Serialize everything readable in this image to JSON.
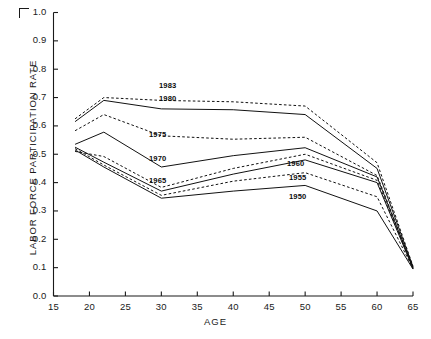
{
  "chart_data": {
    "type": "line",
    "title": "",
    "xlabel": "AGE",
    "ylabel": "LABOR FORCE PARTICIPATION RATE",
    "xlim": [
      15,
      65
    ],
    "ylim": [
      0.0,
      1.0
    ],
    "xticks": [
      "15",
      "20",
      "25",
      "30",
      "35",
      "40",
      "45",
      "50",
      "55",
      "60",
      "65"
    ],
    "yticks": [
      "0.0",
      "0.1",
      "0.2",
      "0.3",
      "0.4",
      "0.5",
      "0.6",
      "0.7",
      "0.8",
      "0.9",
      "1.0"
    ],
    "grid": false,
    "legend_position": "inline-annotations",
    "x": [
      18,
      22,
      30,
      40,
      50,
      60,
      65
    ],
    "series": [
      {
        "name": "1983",
        "style": "dashed",
        "label_x": 159,
        "label_y": 81,
        "values": [
          0.625,
          0.7,
          0.69,
          0.685,
          0.67,
          0.47,
          0.105
        ]
      },
      {
        "name": "1980",
        "style": "solid",
        "label_x": 159,
        "label_y": 94,
        "values": [
          0.615,
          0.69,
          0.66,
          0.657,
          0.64,
          0.45,
          0.103
        ]
      },
      {
        "name": "1975",
        "style": "dashed",
        "label_x": 149,
        "label_y": 130,
        "values": [
          0.583,
          0.64,
          0.565,
          0.553,
          0.56,
          0.425,
          0.101
        ]
      },
      {
        "name": "1970",
        "style": "solid",
        "label_x": 149,
        "label_y": 154,
        "values": [
          0.535,
          0.578,
          0.455,
          0.495,
          0.523,
          0.42,
          0.1
        ]
      },
      {
        "name": "1965",
        "style": "dashed",
        "label_x": 149,
        "label_y": 176,
        "values": [
          0.51,
          0.492,
          0.383,
          0.45,
          0.5,
          0.408,
          0.098
        ]
      },
      {
        "name": "1960",
        "style": "solid",
        "label_x": 287,
        "label_y": 159,
        "values": [
          0.525,
          0.472,
          0.37,
          0.43,
          0.48,
          0.4,
          0.097
        ]
      },
      {
        "name": "1955",
        "style": "dashed",
        "label_x": 289,
        "label_y": 173,
        "values": [
          0.52,
          0.462,
          0.355,
          0.405,
          0.435,
          0.35,
          0.096
        ]
      },
      {
        "name": "1950",
        "style": "solid",
        "label_x": 289,
        "label_y": 192,
        "values": [
          0.515,
          0.455,
          0.345,
          0.37,
          0.39,
          0.3,
          0.095
        ]
      }
    ]
  },
  "axes": {
    "y_axis_label": "LABOR FORCE PARTICIPATION RATE",
    "x_axis_label": "AGE"
  }
}
